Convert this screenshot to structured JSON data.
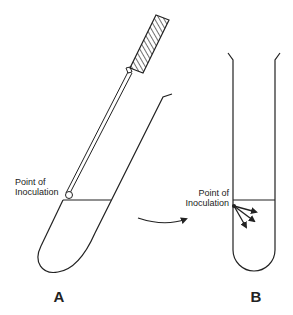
{
  "diagram": {
    "type": "stab inoculation of agar tubes",
    "stroke_color": "#222222",
    "background_color": "#ffffff",
    "tube_a": {
      "label": "A",
      "annotation_line1": "Point of",
      "annotation_line2": "Inoculation",
      "description": "Slanted test tube with inoculating needle inserted at agar surface"
    },
    "tube_b": {
      "label": "B",
      "annotation_line1": "Point of",
      "annotation_line2": "Inoculation",
      "description": "Upright test tube showing arrows spreading from point of inoculation"
    },
    "transition_arrow": "curved arrow from tube A to tube B",
    "icons": [
      "inoculating-needle-icon",
      "test-tube-icon",
      "curved-arrow-icon",
      "spread-arrows-icon"
    ]
  }
}
